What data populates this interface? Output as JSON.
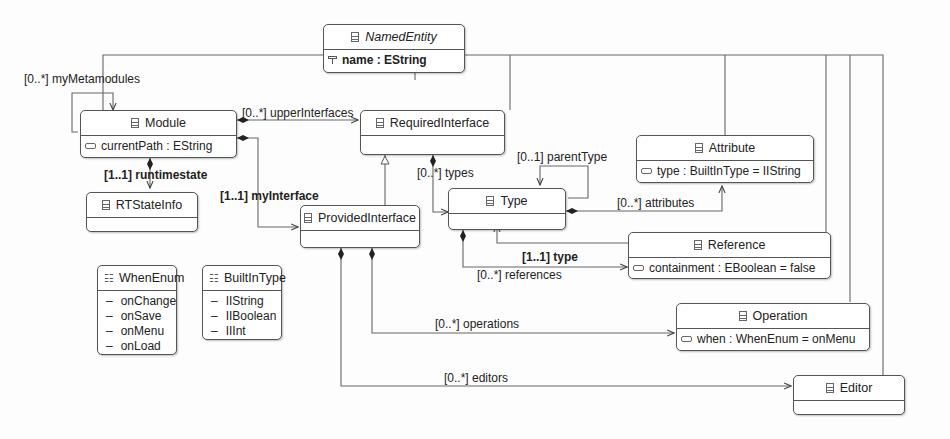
{
  "classes": {
    "named_entity": {
      "name": "NamedEntity",
      "attr": "name : EString"
    },
    "module": {
      "name": "Module",
      "attr": "currentPath : EString"
    },
    "required_interface": {
      "name": "RequiredInterface"
    },
    "rt_state_info": {
      "name": "RTStateInfo"
    },
    "provided_interface": {
      "name": "ProvidedInterface"
    },
    "type": {
      "name": "Type"
    },
    "attribute": {
      "name": "Attribute",
      "attr": "type : BuiltInType = IIString"
    },
    "reference": {
      "name": "Reference",
      "attr": "containment : EBoolean = false"
    },
    "operation": {
      "name": "Operation",
      "attr": "when : WhenEnum = onMenu"
    },
    "editor": {
      "name": "Editor"
    }
  },
  "enums": {
    "when_enum": {
      "name": "WhenEnum",
      "literals": [
        "onChange",
        "onSave",
        "onMenu",
        "onLoad"
      ]
    },
    "builtin_type": {
      "name": "BuiltInType",
      "literals": [
        "IIString",
        "IIBoolean",
        "IIInt"
      ]
    }
  },
  "labels": {
    "my_metamodules": "[0..*] myMetamodules",
    "upper_interfaces": "[0..*] upperInterfaces",
    "runtimestate": "[1..1] runtimestate",
    "my_interface": "[1..1] myInterface",
    "types": "[0..*] types",
    "parent_type": "[0..1] parentType",
    "attributes": "[0..*] attributes",
    "type_ref": "[1..1] type",
    "references": "[0..*] references",
    "operations": "[0..*] operations",
    "editors": "[0..*] editors"
  },
  "symbols": {
    "dash": "–"
  }
}
